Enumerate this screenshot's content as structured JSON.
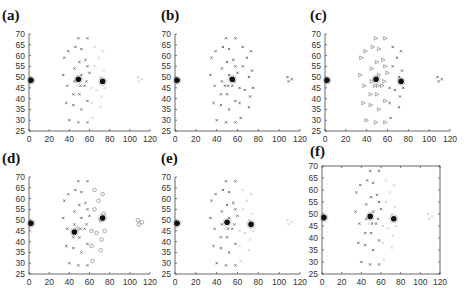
{
  "chart_data": [
    {
      "type": "scatter",
      "panel_label": "(a)",
      "frame": "axes-only",
      "xlim": [
        0,
        120
      ],
      "ylim": [
        25,
        70
      ],
      "xticks": [
        0,
        20,
        40,
        60,
        80,
        100,
        120
      ],
      "yticks": [
        25,
        30,
        35,
        40,
        45,
        50,
        55,
        60,
        65,
        70
      ],
      "grid": false,
      "centroids": [
        [
          2,
          48.5
        ],
        [
          49,
          49
        ],
        [
          73,
          48
        ]
      ],
      "gray_group": "right"
    },
    {
      "type": "scatter",
      "panel_label": "(b)",
      "frame": "axes-only",
      "xlim": [
        0,
        120
      ],
      "ylim": [
        25,
        70
      ],
      "xticks": [
        0,
        20,
        40,
        60,
        80,
        100,
        120
      ],
      "yticks": [
        25,
        30,
        35,
        40,
        45,
        50,
        55,
        60,
        65,
        70
      ],
      "grid": false,
      "centroids": [
        [
          2,
          48.5
        ],
        [
          55,
          49
        ]
      ],
      "gray_group": "none"
    },
    {
      "type": "scatter",
      "panel_label": "(c)",
      "frame": "axes-only",
      "xlim": [
        0,
        120
      ],
      "ylim": [
        25,
        70
      ],
      "xticks": [
        0,
        20,
        40,
        60,
        80,
        100,
        120
      ],
      "yticks": [
        25,
        30,
        35,
        40,
        45,
        50,
        55,
        60,
        65,
        70
      ],
      "grid": false,
      "centroids": [
        [
          2,
          48.5
        ],
        [
          49,
          49
        ],
        [
          73,
          48
        ]
      ],
      "gray_group": "none",
      "marker_style": "triangles-left"
    },
    {
      "type": "scatter",
      "panel_label": "(d)",
      "frame": "axes-only",
      "xlim": [
        0,
        120
      ],
      "ylim": [
        25,
        70
      ],
      "xticks": [
        0,
        20,
        40,
        60,
        80,
        100,
        120
      ],
      "yticks": [
        25,
        30,
        35,
        40,
        45,
        50,
        55,
        60,
        65,
        70
      ],
      "grid": false,
      "centroids": [
        [
          2,
          48.5
        ],
        [
          45,
          44.5
        ],
        [
          73,
          51
        ]
      ],
      "gray_group": "circles-right"
    },
    {
      "type": "scatter",
      "panel_label": "(e)",
      "frame": "axes-only",
      "xlim": [
        0,
        120
      ],
      "ylim": [
        25,
        70
      ],
      "xticks": [
        0,
        20,
        40,
        60,
        80,
        100,
        120
      ],
      "yticks": [
        25,
        30,
        35,
        40,
        45,
        50,
        55,
        60,
        65,
        70
      ],
      "grid": false,
      "centroids": [
        [
          2,
          48.5
        ],
        [
          50,
          49
        ],
        [
          73,
          48
        ]
      ],
      "gray_group": "right"
    },
    {
      "type": "scatter",
      "panel_label": "(f)",
      "frame": "box",
      "xlim": [
        0,
        120
      ],
      "ylim": [
        25,
        70
      ],
      "xticks": [
        0,
        20,
        40,
        60,
        80,
        100,
        120
      ],
      "yticks": [
        25,
        30,
        35,
        40,
        45,
        50,
        55,
        60,
        65,
        70
      ],
      "grid": false,
      "centroids": [
        [
          2,
          48.5
        ],
        [
          49,
          49
        ],
        [
          73,
          48
        ]
      ],
      "gray_group": "right"
    }
  ],
  "points": [
    [
      49,
      68
    ],
    [
      58,
      68
    ],
    [
      46,
      64
    ],
    [
      65,
      64
    ],
    [
      52,
      63
    ],
    [
      39,
      62
    ],
    [
      73,
      62
    ],
    [
      35,
      59
    ],
    [
      69,
      59
    ],
    [
      56,
      58
    ],
    [
      50,
      57
    ],
    [
      65,
      55
    ],
    [
      58,
      55
    ],
    [
      45,
      54
    ],
    [
      74,
      53
    ],
    [
      60,
      52
    ],
    [
      52,
      51
    ],
    [
      34,
      51
    ],
    [
      71,
      50
    ],
    [
      45,
      48
    ],
    [
      57,
      48
    ],
    [
      38,
      46
    ],
    [
      51,
      46
    ],
    [
      55,
      46
    ],
    [
      48,
      46
    ],
    [
      62,
      45
    ],
    [
      75,
      45
    ],
    [
      67,
      44
    ],
    [
      44,
      42
    ],
    [
      50,
      42
    ],
    [
      72,
      41
    ],
    [
      58,
      39
    ],
    [
      37,
      38
    ],
    [
      62,
      38
    ],
    [
      44,
      37
    ],
    [
      71,
      36
    ],
    [
      52,
      35
    ],
    [
      63,
      31
    ],
    [
      40,
      30
    ],
    [
      49,
      29
    ],
    [
      58,
      29
    ],
    [
      108,
      50
    ],
    [
      112,
      49
    ],
    [
      109,
      48
    ],
    [
      1,
      49.5
    ],
    [
      0.5,
      47.5
    ]
  ],
  "right_group_indices": [
    3,
    6,
    8,
    11,
    14,
    18,
    24,
    25,
    26,
    27,
    30,
    33,
    35,
    37,
    41,
    42,
    43
  ]
}
